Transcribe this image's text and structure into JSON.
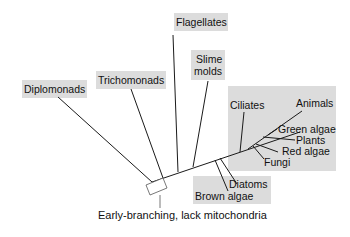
{
  "diagram": {
    "type": "unrooted phylogenetic tree of eukaryotes",
    "groups": [
      {
        "id": "diplomonads",
        "label": "Diplomonads"
      },
      {
        "id": "trichomonads",
        "label": "Trichomonads"
      },
      {
        "id": "flagellates",
        "label": "Flagellates"
      },
      {
        "id": "slime_molds",
        "label_line1": "Slime",
        "label_line2": "molds"
      },
      {
        "id": "ciliates",
        "label": "Ciliates"
      },
      {
        "id": "animals",
        "label": "Animals"
      },
      {
        "id": "green_algae",
        "label": "Green algae"
      },
      {
        "id": "plants",
        "label": "Plants"
      },
      {
        "id": "red_algae",
        "label": "Red algae"
      },
      {
        "id": "fungi",
        "label": "Fungi"
      },
      {
        "id": "diatoms",
        "label": "Diatoms"
      },
      {
        "id": "brown_algae",
        "label": "Brown algae"
      }
    ],
    "annotation": "Early-branching, lack mitochondria",
    "colors": {
      "highlight_box": "#dcdcdc",
      "line": "#1a1a1a",
      "background": "#ffffff"
    }
  }
}
